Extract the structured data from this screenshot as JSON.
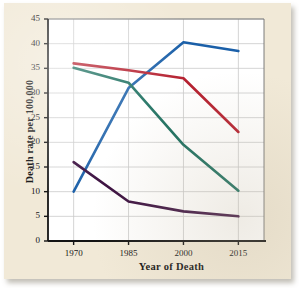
{
  "figure": {
    "paper_color": "#f1e9d7",
    "plot_background": "#ffffff",
    "axis_color": "#141414",
    "grid_color": "#c9c9c9"
  },
  "chart_data": {
    "type": "line",
    "title": "",
    "subtitle": "",
    "xlabel": "Year of Death",
    "ylabel": "Death rate per 100,000",
    "x": [
      1970,
      1985,
      2000,
      2015
    ],
    "categories": [
      "1970",
      "1985",
      "2000",
      "2015"
    ],
    "xtick_labels": [
      "1970",
      "1985",
      "2000",
      "2015"
    ],
    "ytick_labels": [
      "0",
      "5",
      "10",
      "15",
      "20",
      "25",
      "30",
      "35",
      "40",
      "45"
    ],
    "ytick_values": [
      0,
      5,
      10,
      15,
      20,
      25,
      30,
      35,
      40,
      45
    ],
    "xlim": [
      1963,
      2022
    ],
    "ylim": [
      0,
      45
    ],
    "grid": true,
    "grid_axis": "both",
    "legend": "none",
    "legend_position": "none",
    "annotations": [],
    "series": [
      {
        "name": "blue-series",
        "color": "#1a5fa8",
        "values": [
          10.0,
          31.0,
          40.3,
          38.5
        ]
      },
      {
        "name": "red-series",
        "color": "#b5202f",
        "values": [
          36.0,
          34.6,
          33.0,
          22.1
        ]
      },
      {
        "name": "green-series",
        "color": "#1a6e5e",
        "values": [
          35.1,
          32.1,
          19.5,
          10.2
        ]
      },
      {
        "name": "purple-series",
        "color": "#3b1040",
        "values": [
          16.0,
          8.0,
          6.0,
          5.0
        ]
      }
    ]
  }
}
